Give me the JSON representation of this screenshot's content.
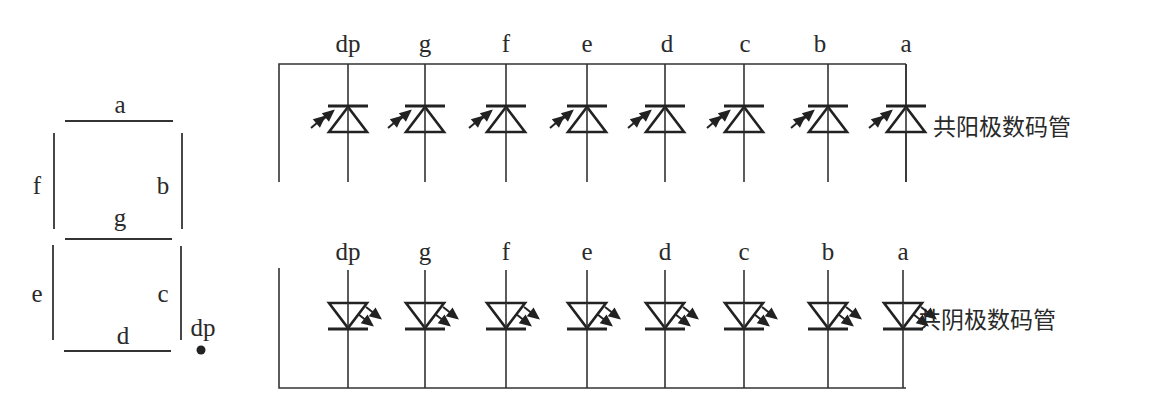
{
  "seven_segment": {
    "segments": [
      {
        "id": "a",
        "label": "a"
      },
      {
        "id": "b",
        "label": "b"
      },
      {
        "id": "c",
        "label": "c"
      },
      {
        "id": "d",
        "label": "d"
      },
      {
        "id": "e",
        "label": "e"
      },
      {
        "id": "f",
        "label": "f"
      },
      {
        "id": "g",
        "label": "g"
      },
      {
        "id": "dp",
        "label": "dp"
      }
    ]
  },
  "common_anode": {
    "title": "共阳极数码管",
    "pins": [
      "dp",
      "g",
      "f",
      "e",
      "d",
      "c",
      "b",
      "a"
    ]
  },
  "common_cathode": {
    "title": "共阴极数码管",
    "pins": [
      "dp",
      "g",
      "f",
      "e",
      "d",
      "c",
      "b",
      "a"
    ]
  },
  "colors": {
    "line": "#333333",
    "text": "#2a2a2a",
    "background": "#ffffff"
  }
}
